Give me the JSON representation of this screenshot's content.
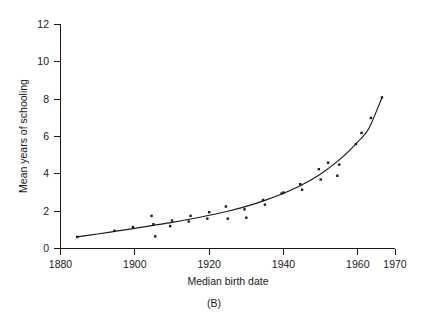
{
  "figure": {
    "panel_caption": "(B)",
    "background_color": "#ffffff",
    "ink_color": "#1a1a1a"
  },
  "chart_data": {
    "type": "scatter",
    "title": "",
    "subtitle": "",
    "xlabel": "Median birth date",
    "ylabel": "Mean years of schooling",
    "xlim": [
      1880,
      1970
    ],
    "ylim": [
      0,
      12.6
    ],
    "grid": false,
    "legend": null,
    "xticks": [
      1880,
      1900,
      1920,
      1940,
      1960,
      1970
    ],
    "xtick_labels": [
      "1880",
      "1900",
      "1920",
      "1940",
      "1960",
      "1970"
    ],
    "yticks": [
      0,
      2,
      4,
      6,
      8,
      10,
      12
    ],
    "ytick_labels": [
      "0",
      "2",
      "4",
      "6",
      "8",
      "10",
      "12"
    ],
    "series": [
      {
        "name": "Observed cohorts",
        "marker": "square",
        "x": [
          1884.5,
          1894.5,
          1899.5,
          1904.5,
          1905.0,
          1905.5,
          1909.5,
          1910.0,
          1914.5,
          1915.0,
          1919.5,
          1920.0,
          1924.5,
          1925.0,
          1929.5,
          1930.0,
          1934.5,
          1935.0,
          1939.5,
          1940.0,
          1944.5,
          1945.0,
          1949.5,
          1950.0,
          1952.0,
          1954.5,
          1955.0,
          1959.5,
          1961.0,
          1963.5,
          1966.5
        ],
        "y": [
          0.62,
          0.95,
          1.15,
          1.75,
          1.3,
          0.65,
          1.2,
          1.5,
          1.45,
          1.75,
          1.6,
          1.95,
          2.25,
          1.6,
          2.1,
          1.65,
          2.6,
          2.35,
          2.95,
          3.0,
          3.45,
          3.15,
          4.25,
          3.7,
          4.6,
          3.9,
          4.5,
          5.6,
          6.2,
          7.0,
          8.1
        ]
      },
      {
        "name": "Fitted trend",
        "marker": "line",
        "x": [
          1884.5,
          1890,
          1895,
          1900,
          1905,
          1910,
          1915,
          1920,
          1925,
          1930,
          1935,
          1940,
          1945,
          1950,
          1955,
          1960,
          1963,
          1966.5
        ],
        "y": [
          0.62,
          0.78,
          0.93,
          1.08,
          1.24,
          1.4,
          1.58,
          1.78,
          2.0,
          2.26,
          2.58,
          2.96,
          3.42,
          4.0,
          4.75,
          5.72,
          6.45,
          8.1
        ]
      }
    ]
  }
}
